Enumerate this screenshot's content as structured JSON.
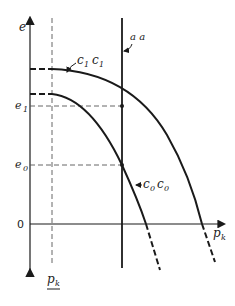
{
  "diagram": {
    "axes": {
      "y_label": "e",
      "x_label": "p",
      "x_label_sub": "k",
      "origin_label": "0"
    },
    "levels": [
      {
        "name": "e1",
        "label": "e",
        "sub": "1"
      },
      {
        "name": "e0",
        "label": "e",
        "sub": "0"
      }
    ],
    "reference_line": {
      "label": "p",
      "sub": "k"
    },
    "vertical_line": {
      "label": "a a"
    },
    "curves": [
      {
        "name": "c1c1",
        "label": "c",
        "sub": "1",
        "label2": "c",
        "sub2": "1"
      },
      {
        "name": "c0c0",
        "label": "c",
        "sub": "0",
        "label2": "c",
        "sub2": "0"
      }
    ],
    "colors": {
      "line": "#1a1a1a",
      "dash": "#555555"
    }
  }
}
